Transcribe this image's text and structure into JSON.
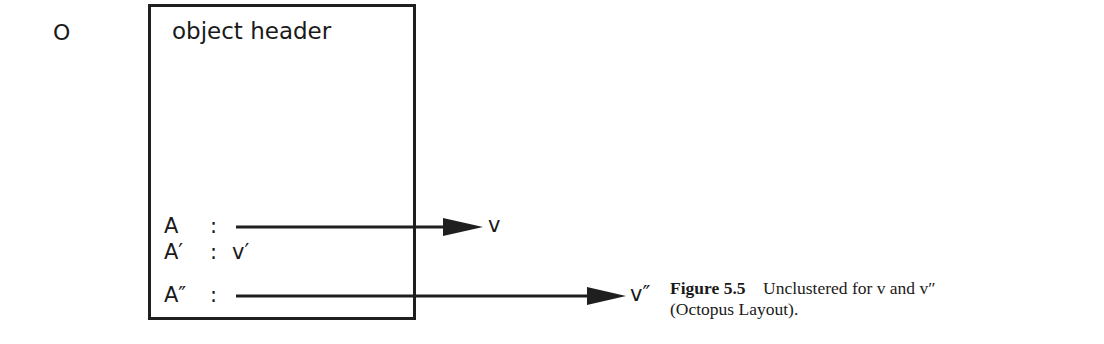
{
  "diagram": {
    "object_label": "O",
    "header": "object header",
    "attributes": [
      {
        "name": "A",
        "separator": ":",
        "value": "",
        "arrow_to": "v"
      },
      {
        "name": "A′",
        "separator": ":",
        "value": "v′",
        "arrow_to": ""
      },
      {
        "name": "A″",
        "separator": ":",
        "value": "",
        "arrow_to": "v″"
      }
    ],
    "targets": [
      "v",
      "v″"
    ]
  },
  "caption": {
    "label": "Figure 5.5",
    "text_line1": "Unclustered for v and v″",
    "text_line2": "(Octopus Layout)."
  }
}
